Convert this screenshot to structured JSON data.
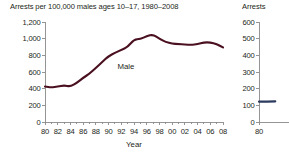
{
  "figure": {
    "axis_color": "#8a8a8a",
    "text_color": "#231f20"
  },
  "main_panel": {
    "title": "Arrests per 100,000 males ages 10–17, 1980–2008",
    "series_label": "Male",
    "xlabel": "Year"
  },
  "side_panel": {
    "title": "Arrests"
  },
  "chart_data": [
    {
      "type": "line",
      "title": "Arrests per 100,000 males ages 10–17, 1980–2008",
      "xlabel": "Year",
      "ylabel": "",
      "xlim": [
        1980,
        2008
      ],
      "ylim": [
        0,
        1200
      ],
      "grid": false,
      "legend": "inline-label",
      "annotations": [
        "Male"
      ],
      "ytick_labels": [
        "0",
        "200",
        "400",
        "600",
        "800",
        "1,000",
        "1,200"
      ],
      "ytick_values": [
        0,
        200,
        400,
        600,
        800,
        1000,
        1200
      ],
      "xtick_labels": [
        "80",
        "82",
        "84",
        "86",
        "88",
        "90",
        "92",
        "94",
        "96",
        "98",
        "00",
        "02",
        "04",
        "06",
        "08"
      ],
      "xtick_values": [
        1980,
        1982,
        1984,
        1986,
        1988,
        1990,
        1992,
        1994,
        1996,
        1998,
        2000,
        2002,
        2004,
        2006,
        2008
      ],
      "x_minor_step": 1,
      "series": [
        {
          "name": "Male",
          "color": "#4a1020",
          "x": [
            1980,
            1981,
            1982,
            1983,
            1984,
            1985,
            1986,
            1987,
            1988,
            1989,
            1990,
            1991,
            1992,
            1993,
            1994,
            1995,
            1996,
            1997,
            1998,
            1999,
            2000,
            2001,
            2002,
            2003,
            2004,
            2005,
            2006,
            2007,
            2008
          ],
          "values": [
            425,
            415,
            425,
            440,
            425,
            470,
            530,
            580,
            650,
            720,
            790,
            830,
            865,
            900,
            990,
            995,
            1030,
            1050,
            1000,
            960,
            940,
            935,
            930,
            925,
            935,
            955,
            955,
            935,
            895
          ]
        }
      ]
    },
    {
      "type": "line",
      "title": "Arrests",
      "xlabel": "",
      "ylabel": "",
      "xlim": [
        1980,
        2008
      ],
      "ylim": [
        0,
        600
      ],
      "grid": false,
      "ytick_labels": [
        "0",
        "100",
        "200",
        "300",
        "400",
        "500",
        "600"
      ],
      "ytick_values": [
        0,
        100,
        200,
        300,
        400,
        500,
        600
      ],
      "xtick_labels": [
        "80"
      ],
      "xtick_values": [
        1980
      ],
      "series": [
        {
          "name": "Arrests",
          "color": "#2b3a5e",
          "x": [
            1980,
            1981,
            1982
          ],
          "values": [
            122,
            122,
            124
          ]
        }
      ]
    }
  ]
}
